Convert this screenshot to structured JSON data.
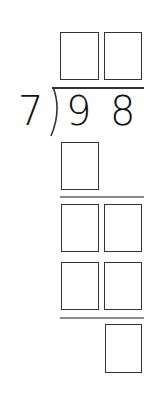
{
  "problem": {
    "divisor": "7",
    "dividend_digits": [
      "9",
      "8"
    ]
  },
  "answer_boxes": {
    "quotient": [
      "",
      ""
    ],
    "step1_product": [
      ""
    ],
    "step1_remainder": [
      "",
      ""
    ],
    "step2_product": [
      "",
      ""
    ],
    "final_remainder": [
      ""
    ]
  },
  "colors": {
    "box_border": "#333333",
    "rule_line": "#8a8a8a",
    "text": "#111111"
  }
}
